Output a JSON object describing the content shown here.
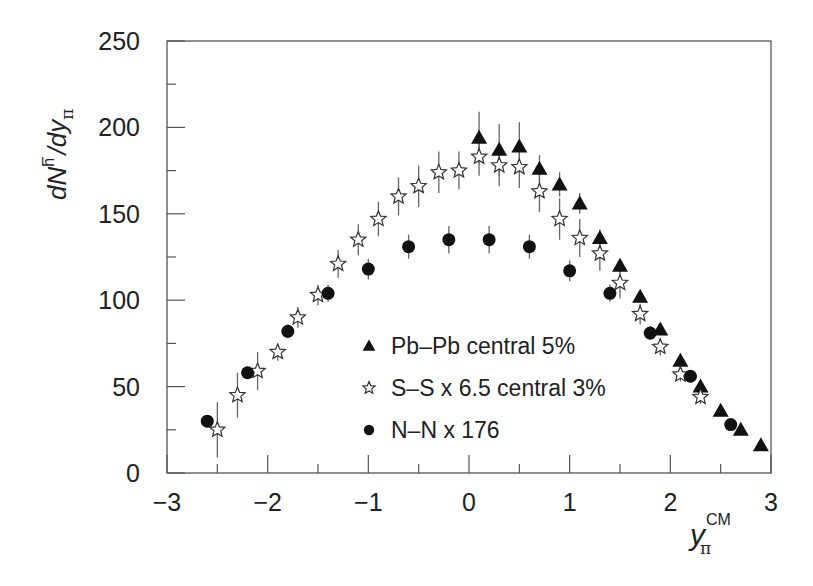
{
  "chart_data": {
    "type": "scatter",
    "title": "",
    "xlabel": "y_π^CM",
    "ylabel": "dN^h⁻/dy_π",
    "xlim": [
      -3,
      3
    ],
    "ylim": [
      0,
      250
    ],
    "x_ticks": [
      -3,
      -2,
      -1,
      0,
      1,
      2,
      3
    ],
    "x_tick_labels": [
      "−3",
      "−2",
      "−1",
      "0",
      "1",
      "2",
      "3"
    ],
    "y_ticks": [
      0,
      50,
      100,
      150,
      200,
      250
    ],
    "y_tick_labels": [
      "0",
      "50",
      "100",
      "150",
      "200",
      "250"
    ],
    "grid": false,
    "legend_position": "inside-lower-center",
    "series": [
      {
        "name": "Pb–Pb  central 5%",
        "marker": "filled-triangle",
        "color": "#111111",
        "x": [
          0.1,
          0.3,
          0.5,
          0.7,
          0.9,
          1.1,
          1.3,
          1.5,
          1.7,
          1.9,
          2.1,
          2.3,
          2.5,
          2.7,
          2.9
        ],
        "y": [
          194,
          187,
          189,
          176,
          167,
          156,
          136,
          120,
          102,
          83,
          65,
          50,
          36,
          25,
          16
        ],
        "yerr": [
          15,
          15,
          14,
          8,
          7,
          6,
          5,
          4,
          3,
          3,
          3,
          3,
          2,
          2,
          2
        ]
      },
      {
        "name": "S–S x 6.5  central 3%",
        "marker": "open-star",
        "color": "#111111",
        "x": [
          -2.5,
          -2.3,
          -2.1,
          -1.9,
          -1.7,
          -1.5,
          -1.3,
          -1.1,
          -0.9,
          -0.7,
          -0.5,
          -0.3,
          -0.1,
          0.1,
          0.3,
          0.5,
          0.7,
          0.9,
          1.1,
          1.3,
          1.5,
          1.7,
          1.9,
          2.1,
          2.3
        ],
        "y": [
          25,
          45,
          59,
          70,
          90,
          103,
          121,
          135,
          147,
          160,
          166,
          174,
          175,
          183,
          178,
          177,
          163,
          147,
          136,
          127,
          110,
          92,
          73,
          57,
          44
        ],
        "yerr": [
          16,
          13,
          11,
          5,
          6,
          6,
          8,
          9,
          10,
          11,
          12,
          12,
          11,
          11,
          12,
          12,
          12,
          12,
          11,
          10,
          9,
          6,
          5,
          4,
          4
        ]
      },
      {
        "name": "N–N x 176",
        "marker": "filled-circle",
        "color": "#111111",
        "x": [
          -2.6,
          -2.2,
          -1.8,
          -1.4,
          -1.0,
          -0.6,
          -0.2,
          0.2,
          0.6,
          1.0,
          1.4,
          1.8,
          2.2,
          2.6
        ],
        "y": [
          30,
          58,
          82,
          104,
          118,
          131,
          135,
          135,
          131,
          117,
          104,
          81,
          56,
          28
        ],
        "yerr": [
          2,
          3,
          4,
          5,
          6,
          7,
          8,
          8,
          7,
          6,
          5,
          4,
          3,
          2
        ]
      }
    ]
  },
  "axes": {
    "y_title_main": "dN",
    "y_title_sup": "h",
    "y_title_minus": "−",
    "y_title_mid": "/dy",
    "y_title_sub": "π",
    "x_title_main": "y",
    "x_title_sup": "CM",
    "x_title_sub": "π"
  },
  "legend": {
    "items": [
      {
        "label": "Pb–Pb  central 5%",
        "marker": "filled-triangle"
      },
      {
        "label": "S–S x 6.5  central 3%",
        "marker": "open-star"
      },
      {
        "label": "N–N x 176",
        "marker": "filled-circle"
      }
    ]
  }
}
